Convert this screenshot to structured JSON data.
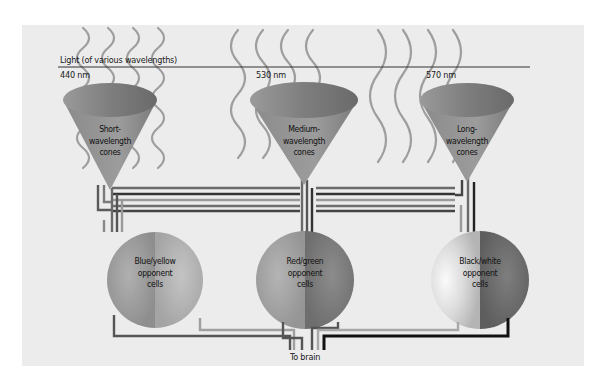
{
  "diagram": {
    "title": "Light (of various wavelengths)",
    "output_label": "To brain",
    "wavelengths": [
      {
        "label": "440 nm"
      },
      {
        "label": "530 nm"
      },
      {
        "label": "570 nm"
      }
    ],
    "cones": [
      {
        "line1": "Short-",
        "line2": "wavelength",
        "line3": "cones"
      },
      {
        "line1": "Medium-",
        "line2": "wavelength",
        "line3": "cones"
      },
      {
        "line1": "Long-",
        "line2": "wavelength",
        "line3": "cones"
      }
    ],
    "cells": [
      {
        "line1": "Blue/yellow",
        "line2": "opponent",
        "line3": "cells"
      },
      {
        "line1": "Red/green",
        "line2": "opponent",
        "line3": "cells"
      },
      {
        "line1": "Black/white",
        "line2": "opponent",
        "line3": "cells"
      }
    ],
    "colors": {
      "background": "#ececec",
      "cone": "#8c8c8c",
      "wave": "#9a9a9a",
      "line_dark": "#3a3a3a",
      "line_mid": "#6e6e6e",
      "line_light": "#a8a8a8",
      "black": "#111111"
    }
  }
}
